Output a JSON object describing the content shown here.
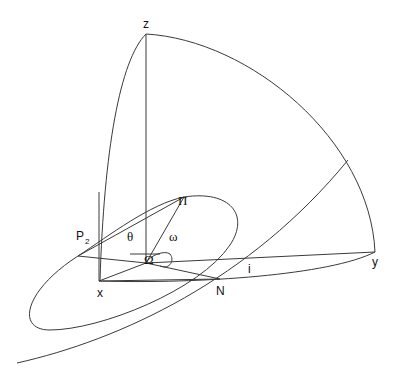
{
  "diagram": {
    "labels": {
      "z": "z",
      "x": "x",
      "y": "y",
      "N": "N",
      "i": "i",
      "P": "P",
      "P_sub": "2",
      "Pi": "Π",
      "theta": "θ",
      "omega": "ω",
      "Omega": "Ω"
    },
    "stroke_color": "#3a3a3a",
    "background": "#ffffff"
  }
}
